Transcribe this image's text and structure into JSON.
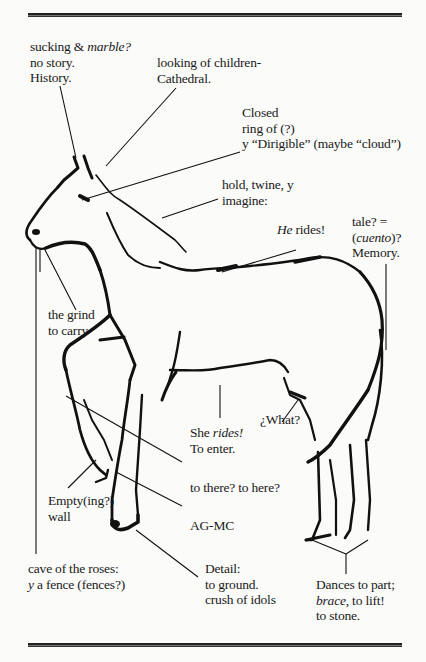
{
  "annotations": {
    "top_left": [
      "sucking & ",
      "marble?",
      "no story.",
      "History."
    ],
    "cathedral": [
      "looking of children-",
      "Cathedral."
    ],
    "closed": [
      "Closed",
      "ring of (?)",
      "y “Dirigible” (maybe “cloud”)"
    ],
    "hold": [
      "hold, twine, y",
      "imagine:"
    ],
    "he_rides": [
      "He",
      " rides!"
    ],
    "tale": [
      "tale? =",
      "(",
      "cuento",
      ")?",
      "Memory."
    ],
    "grind": [
      "the grind",
      "to carry"
    ],
    "she_rides": [
      "She ",
      "rides!",
      "To enter."
    ],
    "what": "¿What?",
    "there": "to there? to here?",
    "empty": [
      "Empty(ing?)",
      "wall"
    ],
    "agmc": "AG-MC",
    "cave": [
      "cave of the roses:",
      "y",
      " a fence (fences?)"
    ],
    "detail": [
      "Detail:",
      "to ground.",
      "crush of idols"
    ],
    "dances": [
      "Dances to part;",
      "brace",
      ", to lift!",
      "to stone."
    ]
  },
  "colors": {
    "ink": "#111111",
    "paper": "#fbfbf9"
  }
}
